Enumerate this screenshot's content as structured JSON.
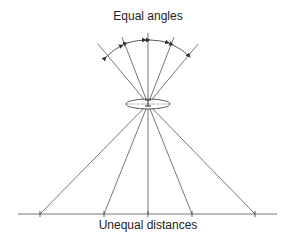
{
  "diagram": {
    "top_label": "Equal angles",
    "bottom_label": "Unequal distances",
    "colors": {
      "line": "#555555",
      "text": "#222222",
      "background": "#ffffff"
    },
    "focal_point": {
      "x": 148,
      "y": 104
    },
    "lens": {
      "cx": 148,
      "cy": 104,
      "rx": 22,
      "ry": 5
    },
    "baseline": {
      "x1": 18,
      "x2": 277,
      "y": 214
    },
    "top_rays": [
      {
        "x": 100,
        "y": 48
      },
      {
        "x": 123,
        "y": 39
      },
      {
        "x": 148,
        "y": 34
      },
      {
        "x": 173,
        "y": 39
      },
      {
        "x": 196,
        "y": 48
      }
    ],
    "bottom_rays": [
      {
        "x": 40,
        "y": 214
      },
      {
        "x": 104,
        "y": 214
      },
      {
        "x": 148,
        "y": 214
      },
      {
        "x": 192,
        "y": 214
      },
      {
        "x": 255,
        "y": 214
      }
    ]
  }
}
